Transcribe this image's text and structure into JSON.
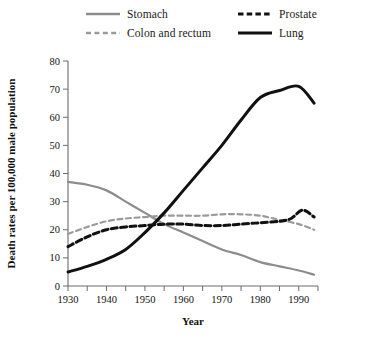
{
  "chart_data": {
    "type": "line",
    "title": "",
    "xlabel": "Year",
    "ylabel": "Death rates per 100,000 male population",
    "xlim": [
      1930,
      1995
    ],
    "ylim": [
      0,
      80
    ],
    "xticks": [
      1930,
      1940,
      1950,
      1960,
      1970,
      1980,
      1990
    ],
    "xtick_labels": [
      "1930",
      "1940",
      "1950",
      "1960",
      "1970",
      "1980",
      "1990"
    ],
    "xminor_step": 5,
    "yticks": [
      0,
      10,
      20,
      30,
      40,
      50,
      60,
      70,
      80
    ],
    "ytick_labels": [
      "0",
      "10",
      "20",
      "30",
      "40",
      "50",
      "60",
      "70",
      "80"
    ],
    "grid": false,
    "legend_position": "top",
    "series": [
      {
        "name": "Stomach",
        "color": "#8c8c8c",
        "style": "solid",
        "width": 2.2,
        "x": [
          1930,
          1935,
          1940,
          1945,
          1950,
          1955,
          1960,
          1965,
          1970,
          1975,
          1980,
          1985,
          1990,
          1994
        ],
        "values": [
          37,
          36,
          34,
          30,
          26,
          22,
          19,
          16,
          13,
          11,
          8.5,
          7,
          5.5,
          4
        ]
      },
      {
        "name": "Colon and rectum",
        "color": "#9a9a9a",
        "style": "dashed",
        "width": 2.2,
        "x": [
          1930,
          1935,
          1940,
          1945,
          1950,
          1955,
          1960,
          1965,
          1970,
          1975,
          1980,
          1985,
          1990,
          1994
        ],
        "values": [
          18.5,
          21,
          23,
          24,
          24.5,
          25,
          25,
          25,
          25.5,
          25.5,
          25,
          23.5,
          22,
          20
        ]
      },
      {
        "name": "Prostate",
        "color": "#111111",
        "style": "dashed",
        "width": 3.0,
        "x": [
          1930,
          1935,
          1940,
          1945,
          1950,
          1955,
          1960,
          1965,
          1970,
          1975,
          1980,
          1985,
          1988,
          1991,
          1994
        ],
        "values": [
          14,
          17.5,
          20,
          21,
          21.5,
          22,
          22,
          21.5,
          21.5,
          22,
          22.5,
          23,
          24,
          27,
          24.5
        ]
      },
      {
        "name": "Lung",
        "color": "#111111",
        "style": "solid",
        "width": 3.0,
        "x": [
          1930,
          1935,
          1940,
          1945,
          1950,
          1955,
          1960,
          1965,
          1970,
          1975,
          1980,
          1985,
          1990,
          1994
        ],
        "values": [
          5,
          7,
          9.5,
          13,
          19,
          26,
          34,
          42,
          50,
          59,
          67,
          69.5,
          71,
          65
        ]
      }
    ]
  },
  "legend": {
    "items": [
      {
        "label": "Stomach",
        "swatch": "line-solid-gray"
      },
      {
        "label": "Colon and rectum",
        "swatch": "line-dashed-gray"
      },
      {
        "label": "Prostate",
        "swatch": "line-dashed-black"
      },
      {
        "label": "Lung",
        "swatch": "line-solid-black"
      }
    ]
  },
  "axes": {
    "x_title": "Year",
    "y_title": "Death rates per 100,000 male population"
  }
}
